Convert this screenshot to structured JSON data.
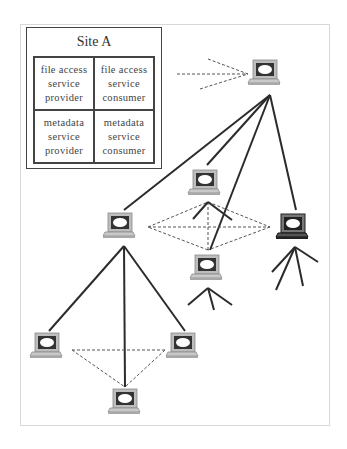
{
  "site_box": {
    "title": "Site A",
    "cells": [
      {
        "lines": [
          "file access",
          "service",
          "provider"
        ]
      },
      {
        "lines": [
          "file access",
          "service",
          "consumer"
        ]
      },
      {
        "lines": [
          "metadata",
          "service",
          "provider"
        ]
      },
      {
        "lines": [
          "metadata",
          "service",
          "consumer"
        ]
      }
    ]
  },
  "nodes": [
    {
      "id": "top",
      "x": 265,
      "y": 73,
      "style": "light"
    },
    {
      "id": "mid-left",
      "x": 118,
      "y": 225,
      "style": "light"
    },
    {
      "id": "center-upper",
      "x": 203,
      "y": 180,
      "style": "light"
    },
    {
      "id": "center-lower",
      "x": 206,
      "y": 267,
      "style": "light"
    },
    {
      "id": "right",
      "x": 292,
      "y": 225,
      "style": "dark"
    },
    {
      "id": "bottom-left",
      "x": 45,
      "y": 345,
      "style": "light"
    },
    {
      "id": "bottom-right",
      "x": 182,
      "y": 345,
      "style": "light"
    },
    {
      "id": "bottom-center",
      "x": 125,
      "y": 400,
      "style": "light"
    }
  ],
  "colors": {
    "line": "#2b2b2b",
    "dashed": "#555555",
    "frame": "#d8d8d8"
  }
}
